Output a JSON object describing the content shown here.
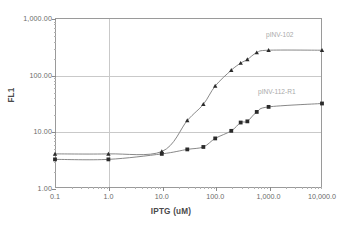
{
  "chart_data": {
    "type": "line",
    "title": "",
    "xlabel": "IPTG (uM)",
    "ylabel": "FL1",
    "xscale": "log",
    "yscale": "log",
    "xlim": [
      0.1,
      10000
    ],
    "ylim": [
      1,
      1000
    ],
    "grid": true,
    "legend_position": "inline-right",
    "x_tick_labels": [
      "0.1",
      "1.0",
      "10.0",
      "100.0",
      "1,000.0",
      "10,000.0"
    ],
    "x_tick_values": [
      0.1,
      1,
      10,
      100,
      1000,
      10000
    ],
    "y_tick_labels": [
      "1.00",
      "10.00",
      "100.00",
      "1,000.00"
    ],
    "y_tick_values": [
      1,
      10,
      100,
      1000
    ],
    "series": [
      {
        "name": "pINV-102",
        "marker": "triangle",
        "color": "#7b7b7b",
        "x": [
          0.1,
          1,
          10,
          30,
          60,
          100,
          200,
          300,
          400,
          600,
          1000,
          10000
        ],
        "y": [
          4.0,
          4.0,
          4.4,
          15.5,
          30,
          63,
          120,
          160,
          185,
          245,
          270,
          270
        ]
      },
      {
        "name": "pINV-112-R1",
        "marker": "square",
        "color": "#7b7b7b",
        "x": [
          0.1,
          1,
          10,
          30,
          60,
          100,
          200,
          300,
          400,
          600,
          1000,
          10000
        ],
        "y": [
          3.2,
          3.2,
          4.0,
          4.8,
          5.3,
          7.5,
          10.2,
          14.3,
          15.0,
          22,
          27,
          31
        ]
      }
    ]
  },
  "labels": {
    "series_1": "pINV-102",
    "series_2": "pINV-112-R1"
  }
}
